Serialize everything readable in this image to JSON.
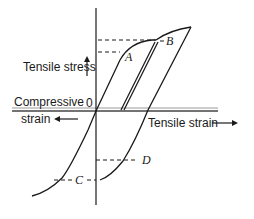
{
  "diagram": {
    "type": "stress-strain hysteresis (Bauschinger effect)",
    "axis_labels": {
      "y_positive": "Tensile stress",
      "x_negative_line1": "Compressive",
      "x_negative_line2": "strain",
      "x_positive": "Tensile strain",
      "origin": "0"
    },
    "points": {
      "A": "A",
      "B": "B",
      "C": "C",
      "D": "D"
    },
    "colors": {
      "ink": "#1a1a1a",
      "axis_gray": "#8a8a8a",
      "background": "#ffffff"
    }
  }
}
